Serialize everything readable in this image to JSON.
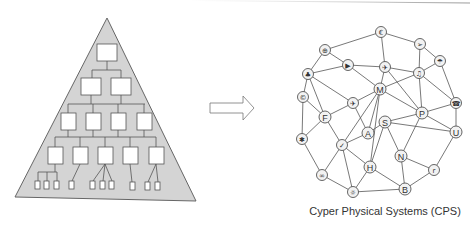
{
  "diagram": {
    "left": {
      "title": "Hierarchical pyramid structure",
      "colors": {
        "fill": "#d4d4d4",
        "stroke": "#666666",
        "box_fill": "#ffffff"
      },
      "levels": [
        1,
        2,
        4,
        5
      ],
      "leaf_groups": [
        3,
        1,
        3,
        1,
        2
      ]
    },
    "arrow": {
      "direction": "right",
      "label": ""
    },
    "right": {
      "caption": "Cyper Physical Systems (CPS)",
      "nodes": [
        {
          "id": "euro",
          "label": "€",
          "icon": "euro-icon",
          "x": 381,
          "y": 32
        },
        {
          "id": "gear1",
          "label": "⊕",
          "icon": "cog-icon",
          "x": 325,
          "y": 50
        },
        {
          "id": "send",
          "label": "➢",
          "icon": "send-icon",
          "x": 420,
          "y": 44
        },
        {
          "id": "play",
          "label": "▶",
          "icon": "play-icon",
          "x": 348,
          "y": 65
        },
        {
          "id": "plane1",
          "label": "✈",
          "icon": "airplane-icon",
          "x": 385,
          "y": 67
        },
        {
          "id": "umbrella",
          "label": "☂",
          "icon": "umbrella-icon",
          "x": 440,
          "y": 61
        },
        {
          "id": "club",
          "label": "♣",
          "icon": "club-icon",
          "x": 308,
          "y": 74
        },
        {
          "id": "music",
          "label": "♫",
          "icon": "music-icon",
          "x": 419,
          "y": 73
        },
        {
          "id": "M",
          "label": "M",
          "icon": "letter-m",
          "x": 380,
          "y": 89
        },
        {
          "id": "phone",
          "label": "☎",
          "icon": "phone-icon",
          "x": 456,
          "y": 103
        },
        {
          "id": "copyright",
          "label": "©",
          "icon": "copyright-icon",
          "x": 303,
          "y": 97
        },
        {
          "id": "plane2",
          "label": "✈",
          "icon": "airplane-icon",
          "x": 353,
          "y": 103
        },
        {
          "id": "F",
          "label": "F",
          "icon": "letter-f",
          "x": 325,
          "y": 117
        },
        {
          "id": "P",
          "label": "P",
          "icon": "letter-p",
          "x": 422,
          "y": 113
        },
        {
          "id": "A",
          "label": "A",
          "icon": "letter-a",
          "x": 368,
          "y": 133
        },
        {
          "id": "S",
          "label": "S",
          "icon": "letter-s",
          "x": 385,
          "y": 122
        },
        {
          "id": "U",
          "label": "U",
          "icon": "letter-u",
          "x": 456,
          "y": 132
        },
        {
          "id": "star",
          "label": "✱",
          "icon": "asterisk-icon",
          "x": 302,
          "y": 139
        },
        {
          "id": "check",
          "label": "✓",
          "icon": "check-icon",
          "x": 342,
          "y": 145
        },
        {
          "id": "N",
          "label": "N",
          "icon": "letter-n",
          "x": 401,
          "y": 156
        },
        {
          "id": "H",
          "label": "H",
          "icon": "letter-h",
          "x": 370,
          "y": 167
        },
        {
          "id": "r",
          "label": "r",
          "icon": "letter-r",
          "x": 434,
          "y": 170
        },
        {
          "id": "infinity",
          "label": "∞",
          "icon": "infinity-icon",
          "x": 322,
          "y": 175
        },
        {
          "id": "B",
          "label": "B",
          "icon": "letter-b",
          "x": 405,
          "y": 189
        },
        {
          "id": "sun",
          "label": "☼",
          "icon": "sun-icon",
          "x": 353,
          "y": 192
        }
      ],
      "edges": [
        [
          "gear1",
          "euro"
        ],
        [
          "euro",
          "send"
        ],
        [
          "euro",
          "plane1"
        ],
        [
          "gear1",
          "play"
        ],
        [
          "gear1",
          "club"
        ],
        [
          "club",
          "play"
        ],
        [
          "play",
          "plane1"
        ],
        [
          "play",
          "M"
        ],
        [
          "send",
          "umbrella"
        ],
        [
          "send",
          "music"
        ],
        [
          "plane1",
          "M"
        ],
        [
          "plane1",
          "music"
        ],
        [
          "plane1",
          "P"
        ],
        [
          "umbrella",
          "music"
        ],
        [
          "umbrella",
          "phone"
        ],
        [
          "music",
          "M"
        ],
        [
          "music",
          "P"
        ],
        [
          "music",
          "phone"
        ],
        [
          "club",
          "copyright"
        ],
        [
          "club",
          "plane2"
        ],
        [
          "club",
          "F"
        ],
        [
          "M",
          "plane2"
        ],
        [
          "M",
          "A"
        ],
        [
          "M",
          "check"
        ],
        [
          "M",
          "P"
        ],
        [
          "M",
          "H"
        ],
        [
          "copyright",
          "F"
        ],
        [
          "copyright",
          "star"
        ],
        [
          "plane2",
          "F"
        ],
        [
          "plane2",
          "A"
        ],
        [
          "F",
          "check"
        ],
        [
          "F",
          "star"
        ],
        [
          "A",
          "check"
        ],
        [
          "A",
          "S"
        ],
        [
          "S",
          "P"
        ],
        [
          "S",
          "U"
        ],
        [
          "S",
          "N"
        ],
        [
          "S",
          "H"
        ],
        [
          "P",
          "phone"
        ],
        [
          "P",
          "U"
        ],
        [
          "P",
          "N"
        ],
        [
          "phone",
          "U"
        ],
        [
          "U",
          "r"
        ],
        [
          "star",
          "infinity"
        ],
        [
          "check",
          "infinity"
        ],
        [
          "check",
          "sun"
        ],
        [
          "check",
          "H"
        ],
        [
          "H",
          "sun"
        ],
        [
          "H",
          "B"
        ],
        [
          "N",
          "B"
        ],
        [
          "N",
          "r"
        ],
        [
          "r",
          "B"
        ],
        [
          "infinity",
          "sun"
        ],
        [
          "sun",
          "B"
        ]
      ]
    }
  }
}
